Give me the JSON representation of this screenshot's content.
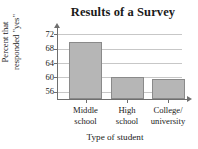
{
  "chart_data": {
    "type": "bar",
    "title": "Results of a Survey",
    "xlabel": "Type of student",
    "ylabel": "Percent that responded \"yes\"",
    "ylabel_lines": [
      "Percent that",
      "responded \"yes\""
    ],
    "categories": [
      "Middle school",
      "High school",
      "College/ university"
    ],
    "category_lines": [
      [
        "Middle",
        "school"
      ],
      [
        "High",
        "school"
      ],
      [
        "College/",
        "university"
      ]
    ],
    "values": [
      70,
      60,
      59.5
    ],
    "ylim": [
      54,
      73.5
    ],
    "yticks": [
      56,
      60,
      64,
      68,
      72
    ],
    "ytick_labels": [
      "56",
      "60",
      "64",
      "68",
      "72"
    ],
    "grid": "horizontal",
    "legend": "none",
    "bar_color": "#b6b6b6",
    "bar_border_color": "#8a8a8a",
    "gridline_color": "#c7c7c7",
    "axis_color": "#6f6f6f",
    "background": "#ffffff"
  }
}
